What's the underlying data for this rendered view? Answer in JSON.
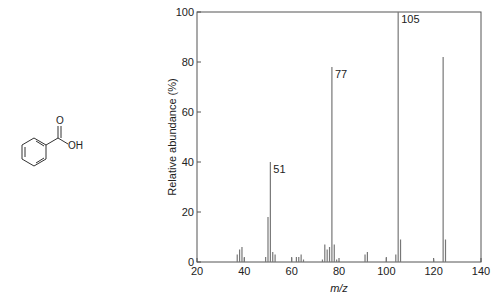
{
  "molecule": {
    "name": "benzoic-acid-structure",
    "labels": {
      "carbonyl_o": "O",
      "hydroxyl": "OH"
    }
  },
  "chart_data": {
    "type": "bar",
    "title": "",
    "xlabel": "m/z",
    "ylabel": "Relative abundance (%)",
    "xlim": [
      20,
      140
    ],
    "ylim": [
      0,
      100
    ],
    "xticks": [
      20,
      40,
      60,
      80,
      100,
      120,
      140
    ],
    "yticks": [
      0,
      20,
      40,
      60,
      80,
      100
    ],
    "grid": false,
    "legend": null,
    "peaks": [
      {
        "mz": 37,
        "value": 3
      },
      {
        "mz": 38,
        "value": 5
      },
      {
        "mz": 39,
        "value": 6
      },
      {
        "mz": 40,
        "value": 2
      },
      {
        "mz": 49,
        "value": 2
      },
      {
        "mz": 50,
        "value": 18
      },
      {
        "mz": 51,
        "value": 40,
        "label": "51"
      },
      {
        "mz": 52,
        "value": 4
      },
      {
        "mz": 53,
        "value": 3
      },
      {
        "mz": 60,
        "value": 2
      },
      {
        "mz": 62,
        "value": 2
      },
      {
        "mz": 63,
        "value": 2
      },
      {
        "mz": 64,
        "value": 3
      },
      {
        "mz": 65,
        "value": 1
      },
      {
        "mz": 73,
        "value": 1
      },
      {
        "mz": 74,
        "value": 7
      },
      {
        "mz": 75,
        "value": 5
      },
      {
        "mz": 76,
        "value": 6
      },
      {
        "mz": 77,
        "value": 78,
        "label": "77"
      },
      {
        "mz": 78,
        "value": 7
      },
      {
        "mz": 79,
        "value": 1
      },
      {
        "mz": 91,
        "value": 3
      },
      {
        "mz": 92,
        "value": 4
      },
      {
        "mz": 100,
        "value": 2
      },
      {
        "mz": 104,
        "value": 3
      },
      {
        "mz": 105,
        "value": 100,
        "label": "105"
      },
      {
        "mz": 106,
        "value": 9
      },
      {
        "mz": 120,
        "value": 1
      },
      {
        "mz": 124,
        "value": 82
      },
      {
        "mz": 125,
        "value": 9
      }
    ]
  }
}
